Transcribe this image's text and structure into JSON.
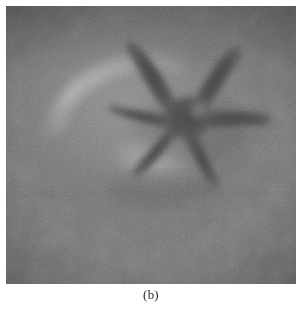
{
  "figure": {
    "caption": "(b)",
    "kind": "grayscale-photograph",
    "frame": {
      "x": 6,
      "y": 6,
      "width": 290,
      "height": 278
    },
    "palette": {
      "page_background": "#ffffff",
      "photo_base_gray": "#717171",
      "photo_dark_gray": "#5b5b5b",
      "photo_light_gray": "#949494",
      "highlight_gray": "#a6a6a6",
      "bowl_rim_gray": "#b0b0b0",
      "starfish_gray": "#4d4d4d",
      "starfish_core_gray": "#454545",
      "vignette_gray": "#5a5a5a",
      "caption_text": "#2b2b2b"
    },
    "scene": {
      "background_tone": "uniform mid-gray sand with fine photographic grain",
      "depression": {
        "label": "shallow bowl-shaped hollow in the sand",
        "center_x": 135,
        "center_y": 118,
        "radius_x": 112,
        "radius_y": 98
      },
      "bowl_rim_arc": {
        "label": "bright crescent highlight along the upper-left rim of the hollow",
        "start_x": 44,
        "start_y": 128,
        "end_x": 178,
        "end_y": 58
      },
      "lower_highlight": {
        "label": "bright sand highlight beneath the starfish",
        "center_x": 160,
        "center_y": 162,
        "radius_x": 46,
        "radius_y": 28
      },
      "horizon_edge": {
        "label": "faint horizontal tonal edge across the lower third",
        "y": 192
      }
    },
    "starfish": {
      "label": "five-armed starfish silhouette",
      "center_x": 184,
      "center_y": 112,
      "disc_radius": 20,
      "arm_count": 5,
      "arms": [
        {
          "name": "arm-upper-left",
          "direction": "up-left, curving",
          "tip_x": 140,
          "tip_y": 42
        },
        {
          "name": "arm-upper-right",
          "direction": "up-right",
          "tip_x": 228,
          "tip_y": 44
        },
        {
          "name": "arm-right",
          "direction": "right",
          "tip_x": 262,
          "tip_y": 120
        },
        {
          "name": "arm-lower-right",
          "direction": "down-right",
          "tip_x": 212,
          "tip_y": 176
        },
        {
          "name": "arm-left",
          "direction": "left",
          "tip_x": 108,
          "tip_y": 104
        },
        {
          "name": "arm-lower-left",
          "direction": "down-left",
          "tip_x": 132,
          "tip_y": 170
        }
      ]
    },
    "grain": {
      "label": "film/scan grain overlay",
      "intensity": "fine, high-frequency speckle"
    }
  }
}
